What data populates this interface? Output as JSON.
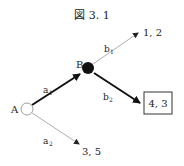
{
  "figure": {
    "title": "図 3. 1"
  },
  "nodes": {
    "A": {
      "label": "A",
      "style": "hollow"
    },
    "B": {
      "label": "B",
      "style": "filled"
    }
  },
  "edges": {
    "a1": {
      "label": "a",
      "sub": "1",
      "from": "A",
      "to": "B",
      "weight": "bold"
    },
    "a2": {
      "label": "a",
      "sub": "2",
      "from": "A",
      "to": "terminal-a2",
      "weight": "thin"
    },
    "b1": {
      "label": "b",
      "sub": "1",
      "from": "B",
      "to": "terminal-b1",
      "weight": "thin"
    },
    "b2": {
      "label": "b",
      "sub": "2",
      "from": "B",
      "to": "terminal-b2",
      "weight": "bold"
    }
  },
  "payoffs": {
    "b1": "1, 2",
    "b2": "4, 3",
    "a2": "3, 5"
  },
  "highlighted_payoff": "b2",
  "colors": {
    "bold_edge": "#111111",
    "thin_edge": "#999999",
    "text": "#222222"
  }
}
